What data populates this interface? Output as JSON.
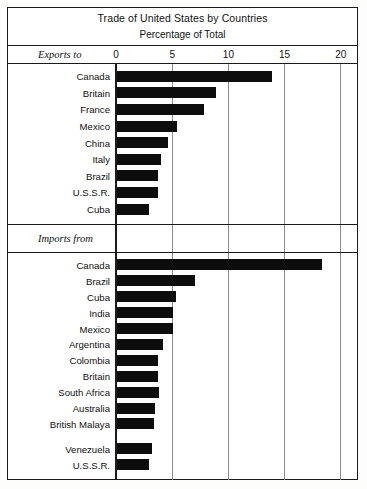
{
  "chart_data": {
    "type": "bar",
    "title": "Trade of United States by Countries",
    "subtitle": "Percentage of Total",
    "xlabel": "Percentage of Total",
    "ylabel": "",
    "orientation": "horizontal",
    "xlim": [
      0,
      22
    ],
    "ticks": [
      {
        "label": "0",
        "value": 0
      },
      {
        "label": "5",
        "value": 5
      },
      {
        "label": "10",
        "value": 10
      },
      {
        "label": "15",
        "value": 15
      },
      {
        "label": "20",
        "value": 20
      }
    ],
    "grid": true,
    "legend": "none",
    "bar_color": "#0d0d0d",
    "sections": [
      {
        "name": "Exports to",
        "categories": [
          "Canada",
          "Britain",
          "France",
          "Mexico",
          "China",
          "Italy",
          "Brazil",
          "U.S.S.R.",
          "Cuba"
        ],
        "values": [
          13.9,
          8.9,
          7.8,
          5.4,
          4.6,
          4.0,
          3.7,
          3.7,
          2.9
        ]
      },
      {
        "name": "Imports from",
        "categories": [
          "Canada",
          "Brazil",
          "Cuba",
          "India",
          "Mexico",
          "Argentina",
          "Colombia",
          "Britain",
          "South Africa",
          "Australia",
          "British Malaya",
          "Venezuela",
          "U.S.S.R."
        ],
        "values": [
          18.3,
          7.0,
          5.3,
          5.1,
          5.1,
          4.2,
          3.7,
          3.7,
          3.8,
          3.5,
          3.4,
          3.2,
          2.9
        ]
      }
    ]
  }
}
